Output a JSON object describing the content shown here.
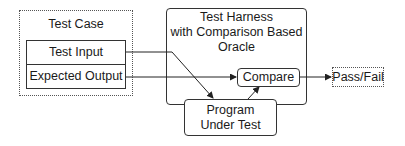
{
  "diagram": {
    "test_case": {
      "title": "Test Case",
      "items": [
        {
          "label": "Test Input"
        },
        {
          "label": "Expected Output"
        }
      ]
    },
    "harness": {
      "title_line1": "Test Harness",
      "title_line2": "with Comparison Based",
      "title_line3": "Oracle"
    },
    "compare": {
      "label": "Compare"
    },
    "program": {
      "line1": "Program",
      "line2": "Under Test"
    },
    "result": {
      "label": "Pass/Fail"
    }
  }
}
